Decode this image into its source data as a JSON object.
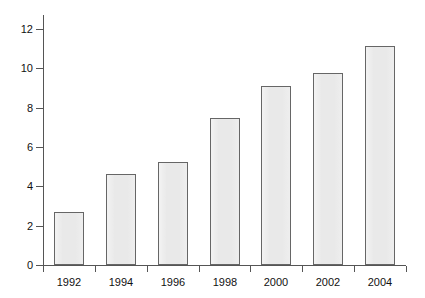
{
  "chart_data": {
    "type": "bar",
    "title": "",
    "subtitle": "",
    "xlabel": "",
    "ylabel": "$ billion",
    "categories": [
      "1992",
      "1994",
      "1996",
      "1998",
      "2000",
      "2002",
      "2004"
    ],
    "values": [
      2.7,
      4.6,
      5.25,
      7.45,
      9.1,
      9.75,
      11.15
    ],
    "ylim": [
      0,
      12.7
    ],
    "xlim_note": "categorical",
    "ytick_labels": [
      "0",
      "2",
      "4",
      "6",
      "8",
      "10",
      "12"
    ],
    "ytick_values": [
      0,
      2,
      4,
      6,
      8,
      10,
      12
    ],
    "grid": false,
    "legend": null,
    "legend_position": "none",
    "annotations": [],
    "bar_fill_color": "#e9e9e9",
    "bar_border_color": "#666666",
    "axis_color": "#555555",
    "background_color": "#ffffff",
    "text_color": "#111111"
  }
}
